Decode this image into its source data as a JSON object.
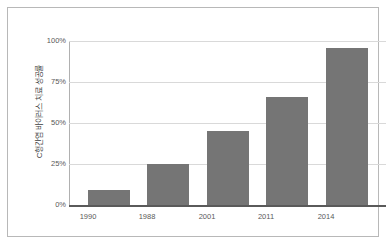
{
  "chart_data": {
    "type": "bar",
    "title": "",
    "xlabel": "",
    "ylabel": "C형간염 바이러스 치료 성공률",
    "categories": [
      "1990",
      "1988",
      "2001",
      "2011",
      "2014"
    ],
    "values": [
      9,
      25,
      45,
      66,
      96
    ],
    "value_labels": [
      "9%",
      "25%",
      "45%",
      "66%",
      "96%"
    ],
    "ytick_labels": [
      "0%",
      "25%",
      "50%",
      "75%",
      "100%"
    ],
    "ytick_values": [
      0,
      25,
      50,
      75,
      100
    ],
    "ylim": [
      0,
      100
    ],
    "grid": true,
    "legend": false,
    "legend_position": "none",
    "series": [
      {
        "name": "C형간염 바이러스 치료 성공률",
        "values": [
          9,
          25,
          45,
          66,
          96
        ]
      }
    ]
  },
  "colors": {
    "bar": "#757575",
    "gridline": "#d9d9d9",
    "axis": "#5a5a5a",
    "frame_border": "#b8b8b8",
    "tick_text": "#595959",
    "axis_title_text": "#3f3f3f",
    "background": "#ffffff"
  }
}
